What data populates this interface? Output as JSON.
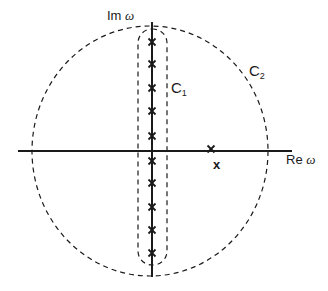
{
  "diagram": {
    "type": "complex-plane-contours",
    "axes": {
      "real_label": "Re",
      "imag_label": "Im",
      "variable": "ω"
    },
    "contours": [
      {
        "id": "C1",
        "label": "C",
        "subscript": "1",
        "shape": "rounded-rectangle",
        "style": "dashed"
      },
      {
        "id": "C2",
        "label": "C",
        "subscript": "2",
        "shape": "circle",
        "style": "dashed"
      }
    ],
    "poles_on_imag_axis": [
      42,
      64,
      88,
      111,
      136,
      161,
      183,
      207,
      230,
      253
    ],
    "pole_on_real_axis": {
      "x": 211,
      "y": 151
    },
    "extra_marker": "x",
    "colors": {
      "line": "#1a1a1a",
      "background": "#ffffff"
    }
  }
}
